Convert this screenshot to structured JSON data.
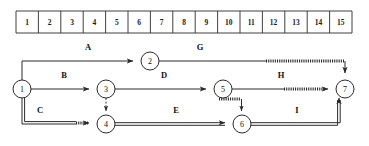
{
  "diagram": {
    "type": "time-scaled-network-cpm",
    "title": "",
    "timescale": {
      "name": "day-scale",
      "start_x": 16,
      "end_x": 352,
      "top": 11,
      "bottom": 33,
      "ticks": [
        "1",
        "2",
        "3",
        "4",
        "5",
        "6",
        "7",
        "8",
        "9",
        "10",
        "11",
        "12",
        "13",
        "14",
        "15"
      ]
    },
    "nodes": [
      {
        "id": "1",
        "label": "1",
        "x": 22,
        "y": 89,
        "r": 9
      },
      {
        "id": "2",
        "label": "2",
        "x": 150,
        "y": 61,
        "r": 9
      },
      {
        "id": "3",
        "label": "3",
        "x": 106,
        "y": 89,
        "r": 9
      },
      {
        "id": "4",
        "label": "4",
        "x": 106,
        "y": 124,
        "r": 9
      },
      {
        "id": "5",
        "label": "5",
        "x": 223,
        "y": 89,
        "r": 9
      },
      {
        "id": "6",
        "label": "6",
        "x": 242,
        "y": 124,
        "r": 9
      },
      {
        "id": "7",
        "label": "7",
        "x": 345,
        "y": 89,
        "r": 9
      }
    ],
    "activities": [
      {
        "id": "A",
        "label": "A",
        "from": "1",
        "to": "2",
        "critical": false,
        "float": false,
        "label_x": 88,
        "label_y": 48
      },
      {
        "id": "B",
        "label": "B",
        "from": "1",
        "to": "3",
        "critical": false,
        "float": false,
        "label_x": 64,
        "label_y": 76
      },
      {
        "id": "C",
        "label": "C",
        "from": "1",
        "to": "4",
        "critical": true,
        "float": true,
        "label_x": 40,
        "label_y": 111
      },
      {
        "id": "D",
        "label": "D",
        "from": "3",
        "to": "5",
        "critical": false,
        "float": false,
        "label_x": 164,
        "label_y": 76
      },
      {
        "id": "E",
        "label": "E",
        "from": "4",
        "to": "6",
        "critical": true,
        "float": false,
        "label_x": 176,
        "label_y": 111
      },
      {
        "id": "G",
        "label": "G",
        "from": "2",
        "to": "7",
        "critical": false,
        "float": true,
        "label_x": 200,
        "label_y": 48
      },
      {
        "id": "H",
        "label": "H",
        "from": "5",
        "to": "7",
        "critical": false,
        "float": true,
        "label_x": 281,
        "label_y": 76
      },
      {
        "id": "I",
        "label": "I",
        "from": "6",
        "to": "7",
        "critical": true,
        "float": false,
        "label_x": 297,
        "label_y": 111
      }
    ],
    "dummies": [
      {
        "id": "dummy-3-4",
        "from": "3",
        "to": "4",
        "style": "dashed"
      },
      {
        "id": "dummy-5-6",
        "from": "5",
        "to": "6",
        "style": "hatched"
      }
    ],
    "legend_note": ""
  }
}
